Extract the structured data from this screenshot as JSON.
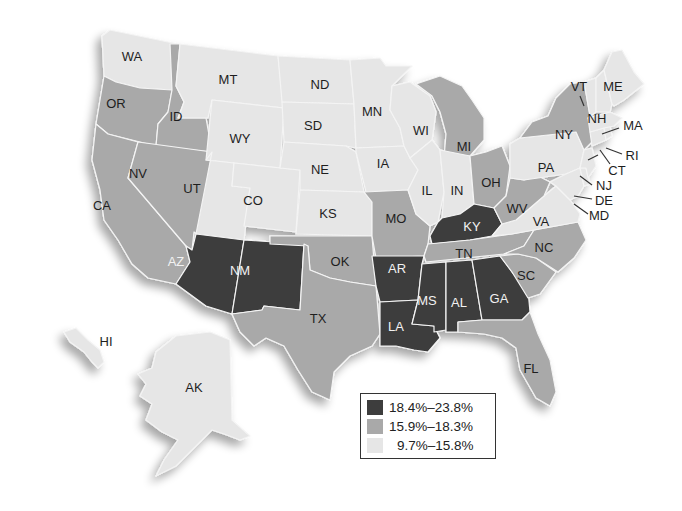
{
  "map": {
    "colors": {
      "high": "#3d3d3d",
      "mid": "#a9a9a9",
      "low": "#e6e6e6",
      "label_dark": "#1e1e1e",
      "label_light": "#f2f2f2"
    },
    "states": [
      {
        "abbr": "WA",
        "class": "low"
      },
      {
        "abbr": "OR",
        "class": "mid"
      },
      {
        "abbr": "CA",
        "class": "mid"
      },
      {
        "abbr": "ID",
        "class": "mid"
      },
      {
        "abbr": "NV",
        "class": "mid"
      },
      {
        "abbr": "MT",
        "class": "low"
      },
      {
        "abbr": "WY",
        "class": "low"
      },
      {
        "abbr": "UT",
        "class": "low"
      },
      {
        "abbr": "CO",
        "class": "low"
      },
      {
        "abbr": "AZ",
        "class": "high"
      },
      {
        "abbr": "NM",
        "class": "high"
      },
      {
        "abbr": "ND",
        "class": "low"
      },
      {
        "abbr": "SD",
        "class": "low"
      },
      {
        "abbr": "NE",
        "class": "low"
      },
      {
        "abbr": "KS",
        "class": "low"
      },
      {
        "abbr": "OK",
        "class": "mid"
      },
      {
        "abbr": "TX",
        "class": "mid"
      },
      {
        "abbr": "MN",
        "class": "low"
      },
      {
        "abbr": "IA",
        "class": "low"
      },
      {
        "abbr": "MO",
        "class": "mid"
      },
      {
        "abbr": "AR",
        "class": "high"
      },
      {
        "abbr": "LA",
        "class": "high"
      },
      {
        "abbr": "WI",
        "class": "low"
      },
      {
        "abbr": "IL",
        "class": "low"
      },
      {
        "abbr": "MI",
        "class": "mid"
      },
      {
        "abbr": "IN",
        "class": "low"
      },
      {
        "abbr": "OH",
        "class": "mid"
      },
      {
        "abbr": "KY",
        "class": "high"
      },
      {
        "abbr": "TN",
        "class": "mid"
      },
      {
        "abbr": "MS",
        "class": "high"
      },
      {
        "abbr": "AL",
        "class": "high"
      },
      {
        "abbr": "GA",
        "class": "high"
      },
      {
        "abbr": "FL",
        "class": "mid"
      },
      {
        "abbr": "SC",
        "class": "mid"
      },
      {
        "abbr": "NC",
        "class": "mid"
      },
      {
        "abbr": "VA",
        "class": "low"
      },
      {
        "abbr": "WV",
        "class": "mid"
      },
      {
        "abbr": "PA",
        "class": "low"
      },
      {
        "abbr": "NY",
        "class": "mid"
      },
      {
        "abbr": "VT",
        "class": "low"
      },
      {
        "abbr": "NH",
        "class": "low"
      },
      {
        "abbr": "ME",
        "class": "low"
      },
      {
        "abbr": "MA",
        "class": "low"
      },
      {
        "abbr": "RI",
        "class": "low"
      },
      {
        "abbr": "CT",
        "class": "low"
      },
      {
        "abbr": "NJ",
        "class": "low"
      },
      {
        "abbr": "DE",
        "class": "low"
      },
      {
        "abbr": "MD",
        "class": "low"
      },
      {
        "abbr": "AK",
        "class": "low"
      },
      {
        "abbr": "HI",
        "class": "low"
      }
    ]
  },
  "legend": {
    "items": [
      {
        "label": "18.4%–23.8%",
        "color": "#3d3d3d"
      },
      {
        "label": "15.9%–18.3%",
        "color": "#a9a9a9"
      },
      {
        "label": "9.7%–15.8%",
        "color": "#e6e6e6"
      }
    ]
  }
}
